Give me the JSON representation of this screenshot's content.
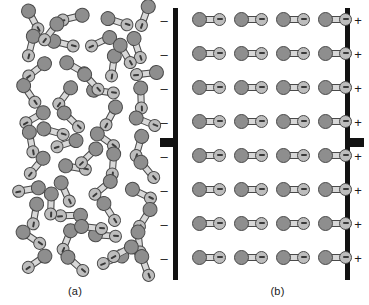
{
  "figure": {
    "width": 369,
    "height": 305,
    "background_color": "#ffffff"
  },
  "panels": [
    {
      "id": "a",
      "caption": "(a)",
      "description": "Randomly oriented polar molecules with no applied field",
      "molecule_count": 52,
      "ordered": false
    },
    {
      "id": "b",
      "caption": "(b)",
      "description": "Polar molecules aligned between charged parallel plates",
      "molecule_count": 32,
      "ordered": true,
      "rows": 8,
      "columns": 4
    }
  ],
  "electrodes": {
    "negative": {
      "name": "negative-plate",
      "polarity_symbol": "–",
      "symbol_count": 8,
      "color": "#121212",
      "has_lead": true
    },
    "positive": {
      "name": "positive-plate",
      "polarity_symbol": "+",
      "symbol_count": 8,
      "color": "#121212",
      "has_lead": true
    }
  },
  "molecule": {
    "negative_lobe_color": "#8e8e8e",
    "positive_lobe_color": "#bdbdbd",
    "outline_color": "#4a4a4a",
    "bond_color": "#d8d8d8",
    "sign_symbol": "–",
    "sign_on_lobe": "positive"
  },
  "chart_data": {
    "type": "scatter",
    "xlabel": "",
    "ylabel": "",
    "panel_a_molecules": [
      {
        "x": 16,
        "y": 12,
        "angle": 62
      },
      {
        "x": 56,
        "y": 10,
        "angle": 166
      },
      {
        "x": 100,
        "y": 14,
        "angle": 18
      },
      {
        "x": 128,
        "y": 8,
        "angle": 110
      },
      {
        "x": 14,
        "y": 38,
        "angle": 104
      },
      {
        "x": 46,
        "y": 36,
        "angle": 14
      },
      {
        "x": 84,
        "y": 34,
        "angle": 155
      },
      {
        "x": 120,
        "y": 40,
        "angle": 72
      },
      {
        "x": 20,
        "y": 62,
        "angle": 142
      },
      {
        "x": 58,
        "y": 60,
        "angle": 30
      },
      {
        "x": 96,
        "y": 58,
        "angle": 98
      },
      {
        "x": 130,
        "y": 66,
        "angle": 174
      },
      {
        "x": 12,
        "y": 86,
        "angle": 56
      },
      {
        "x": 48,
        "y": 88,
        "angle": 126
      },
      {
        "x": 86,
        "y": 84,
        "angle": 8
      },
      {
        "x": 124,
        "y": 90,
        "angle": 88
      },
      {
        "x": 18,
        "y": 110,
        "angle": 150
      },
      {
        "x": 54,
        "y": 112,
        "angle": 44
      },
      {
        "x": 94,
        "y": 108,
        "angle": 118
      },
      {
        "x": 128,
        "y": 114,
        "angle": 22
      },
      {
        "x": 14,
        "y": 134,
        "angle": 80
      },
      {
        "x": 50,
        "y": 136,
        "angle": 162
      },
      {
        "x": 88,
        "y": 132,
        "angle": 36
      },
      {
        "x": 122,
        "y": 138,
        "angle": 106
      },
      {
        "x": 20,
        "y": 158,
        "angle": 130
      },
      {
        "x": 58,
        "y": 160,
        "angle": 10
      },
      {
        "x": 96,
        "y": 156,
        "angle": 94
      },
      {
        "x": 130,
        "y": 162,
        "angle": 50
      },
      {
        "x": 12,
        "y": 182,
        "angle": 170
      },
      {
        "x": 48,
        "y": 184,
        "angle": 66
      },
      {
        "x": 86,
        "y": 180,
        "angle": 140
      },
      {
        "x": 124,
        "y": 186,
        "angle": 26
      },
      {
        "x": 18,
        "y": 206,
        "angle": 100
      },
      {
        "x": 54,
        "y": 208,
        "angle": 178
      },
      {
        "x": 92,
        "y": 204,
        "angle": 58
      },
      {
        "x": 128,
        "y": 210,
        "angle": 122
      },
      {
        "x": 14,
        "y": 230,
        "angle": 34
      },
      {
        "x": 50,
        "y": 232,
        "angle": 112
      },
      {
        "x": 88,
        "y": 228,
        "angle": 4
      },
      {
        "x": 122,
        "y": 234,
        "angle": 84
      },
      {
        "x": 20,
        "y": 254,
        "angle": 146
      },
      {
        "x": 58,
        "y": 256,
        "angle": 42
      },
      {
        "x": 96,
        "y": 252,
        "angle": 158
      },
      {
        "x": 128,
        "y": 258,
        "angle": 70
      },
      {
        "x": 34,
        "y": 24,
        "angle": 128
      },
      {
        "x": 74,
        "y": 74,
        "angle": 48
      },
      {
        "x": 36,
        "y": 124,
        "angle": 16
      },
      {
        "x": 72,
        "y": 148,
        "angle": 136
      },
      {
        "x": 34,
        "y": 196,
        "angle": 92
      },
      {
        "x": 74,
        "y": 220,
        "angle": 6
      },
      {
        "x": 108,
        "y": 46,
        "angle": 60
      },
      {
        "x": 106,
        "y": 244,
        "angle": 152
      }
    ],
    "panel_b_grid": {
      "columns_x": [
        6,
        48,
        90,
        132
      ],
      "rows_y": [
        12,
        46,
        80,
        114,
        148,
        182,
        216,
        250
      ],
      "angle": 0
    },
    "charge_rows_y": [
      14,
      48,
      82,
      116,
      150,
      184,
      218,
      252
    ]
  }
}
